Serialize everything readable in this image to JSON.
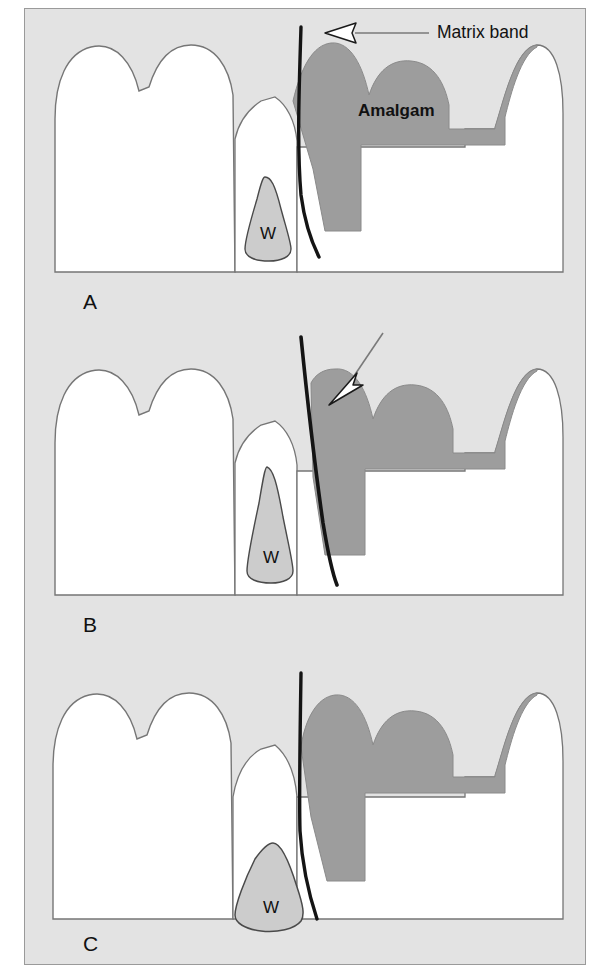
{
  "figure": {
    "panels": [
      {
        "letter": "A",
        "description": "Matrix band vertical, wedge placed apically, amalgam with proper contact",
        "wedge_label": "W",
        "band_orientation": "vertical",
        "arrow": "hollow-left-arrow-with-leader"
      },
      {
        "letter": "B",
        "description": "Matrix band tilted, wedge pushes band into proximal space",
        "wedge_label": "W",
        "band_orientation": "tilted",
        "arrow": "hollow-down-left-arrow-with-leader"
      },
      {
        "letter": "C",
        "description": "Matrix band vertical with broad wedge seated at gingival margin",
        "wedge_label": "W",
        "band_orientation": "vertical",
        "arrow": "none"
      }
    ],
    "annotations": {
      "matrix_band_label": "Matrix band",
      "amalgam_label": "Amalgam",
      "wedge_label": "W"
    },
    "colors": {
      "background": "#e3e3e3",
      "border": "#9a9a9a",
      "tooth_fill": "#ffffff",
      "tooth_outline": "#767676",
      "amalgam_fill": "#9d9d9d",
      "amalgam_outline": "#8a8a8a",
      "wedge_fill": "#cccccc",
      "wedge_outline": "#4a4a4a",
      "band_stroke": "#141414",
      "text": "#111111"
    }
  }
}
